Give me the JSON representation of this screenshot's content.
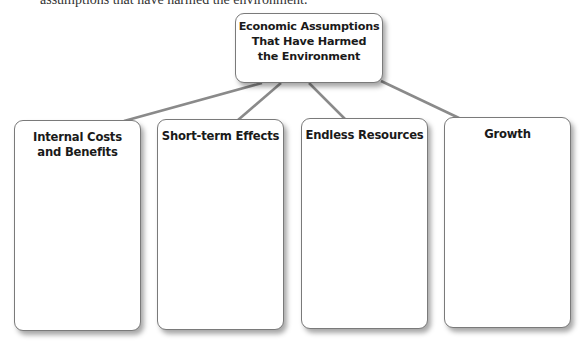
{
  "header": {
    "clipped_text": "assumptions that have harmed the environment."
  },
  "diagram": {
    "central": {
      "lines": [
        "Economic Assumptions",
        "That Have Harmed",
        "the Environment"
      ]
    },
    "children": [
      {
        "lines": [
          "Internal Costs",
          "and Benefits"
        ],
        "body": ""
      },
      {
        "lines": [
          "Short-term Effects"
        ],
        "body": ""
      },
      {
        "lines": [
          "Endless Resources"
        ],
        "body": ""
      },
      {
        "lines": [
          "Growth"
        ],
        "body": ""
      }
    ],
    "colors": {
      "connector": "#8a8a8a",
      "border": "#7a7a7a",
      "text": "#1a1a1a"
    }
  }
}
